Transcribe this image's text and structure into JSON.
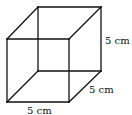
{
  "figure": {
    "type": "cube",
    "stroke_color": "#111111",
    "background": "#ffffff"
  },
  "labels": {
    "height": "5 cm",
    "depth": "5 cm",
    "width": "5 cm"
  },
  "vertices": {
    "front_top_left": [
      7,
      39
    ],
    "front_top_right": [
      69,
      39
    ],
    "front_bottom_left": [
      7,
      102
    ],
    "front_bottom_right": [
      69,
      102
    ],
    "back_top_left": [
      38,
      7
    ],
    "back_top_right": [
      101,
      7
    ],
    "back_bottom_left": [
      38,
      71
    ],
    "back_bottom_right": [
      101,
      71
    ]
  }
}
